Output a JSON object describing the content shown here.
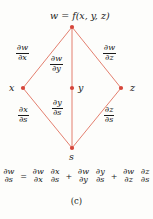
{
  "figure": {
    "caption": "(c)",
    "edge_color": "#e0705f",
    "node_color": "#d6453a",
    "text_color": "#1a1a1a",
    "background": "#fdfdfb"
  },
  "nodes": {
    "top": {
      "id": "w",
      "label": "w = f(x, y, z)",
      "x": 72,
      "y": 27
    },
    "left": {
      "id": "x",
      "label": "x",
      "x": 23,
      "y": 88
    },
    "middle": {
      "id": "y",
      "label": "y",
      "x": 72,
      "y": 88
    },
    "right": {
      "id": "z",
      "label": "z",
      "x": 121,
      "y": 88
    },
    "bottom": {
      "id": "s",
      "label": "s",
      "x": 72,
      "y": 148
    }
  },
  "edges": [
    {
      "id": "w-x",
      "from": "w",
      "to": "x",
      "num": "∂w",
      "den": "∂x"
    },
    {
      "id": "w-y",
      "from": "w",
      "to": "y",
      "num": "∂w",
      "den": "∂y"
    },
    {
      "id": "w-z",
      "from": "w",
      "to": "z",
      "num": "∂w",
      "den": "∂z"
    },
    {
      "id": "x-s",
      "from": "x",
      "to": "s",
      "num": "∂x",
      "den": "∂s"
    },
    {
      "id": "y-s",
      "from": "y",
      "to": "s",
      "num": "∂y",
      "den": "∂s"
    },
    {
      "id": "z-s",
      "from": "z",
      "to": "s",
      "num": "∂z",
      "den": "∂s"
    }
  ],
  "equation": {
    "lhs": {
      "num": "∂w",
      "den": "∂s"
    },
    "equals": "=",
    "terms": [
      {
        "operator": "",
        "factor1": {
          "num": "∂w",
          "den": "∂x"
        },
        "factor2": {
          "num": "∂x",
          "den": "∂s"
        }
      },
      {
        "operator": "+",
        "factor1": {
          "num": "∂w",
          "den": "∂y"
        },
        "factor2": {
          "num": "∂y",
          "den": "∂s"
        }
      },
      {
        "operator": "+",
        "factor1": {
          "num": "∂w",
          "den": "∂z"
        },
        "factor2": {
          "num": "∂z",
          "den": "∂s"
        }
      }
    ]
  }
}
